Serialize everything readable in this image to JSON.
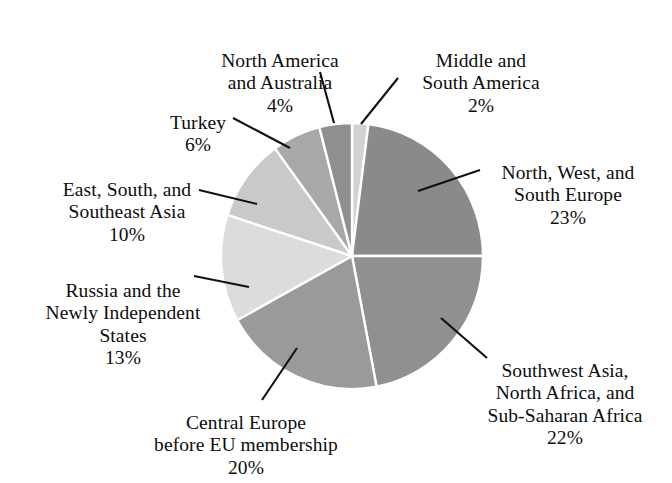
{
  "chart_data": {
    "type": "pie",
    "title": "",
    "subtitle": "",
    "xlabel": "",
    "ylabel": "",
    "legend_position": "none",
    "grid": false,
    "units": "percent",
    "start_angle_deg": 0,
    "direction": "clockwise",
    "center": {
      "x": 352,
      "y": 256
    },
    "radius": {
      "rx": 131,
      "ry": 133
    },
    "slice_gap_color": "#ffffff",
    "categories": [
      "Middle and South America",
      "North, West, and South Europe",
      "Southwest Asia, North Africa, and Sub-Saharan Africa",
      "Central Europe before EU membership",
      "Russia and the Newly Independent States",
      "East, South, and Southeast Asia",
      "Turkey",
      "North America and Australia"
    ],
    "values": [
      2,
      23,
      22,
      20,
      13,
      10,
      6,
      4
    ],
    "colors": [
      "#d2d2d2",
      "#8a8a8a",
      "#909090",
      "#9a9a9a",
      "#dcdcdc",
      "#c9c9c9",
      "#a8a8a8",
      "#8f8f8f"
    ],
    "slices": [
      {
        "id": "middle-south-america",
        "label": "Middle and\nSouth America",
        "percent_text": "2%",
        "value": 2,
        "color": "#d2d2d2",
        "start_deg": 0.0,
        "end_deg": 7.2
      },
      {
        "id": "north-west-south-europe",
        "label": "North, West, and\nSouth Europe",
        "percent_text": "23%",
        "value": 23,
        "color": "#8a8a8a",
        "start_deg": 7.2,
        "end_deg": 90.0
      },
      {
        "id": "southwest-asia-africa",
        "label": "Southwest Asia,\nNorth Africa, and\nSub-Saharan Africa",
        "percent_text": "22%",
        "value": 22,
        "color": "#909090",
        "start_deg": 90.0,
        "end_deg": 169.2
      },
      {
        "id": "central-europe",
        "label": "Central Europe\nbefore EU membership",
        "percent_text": "20%",
        "value": 20,
        "color": "#9a9a9a",
        "start_deg": 169.2,
        "end_deg": 241.2
      },
      {
        "id": "russia-nis",
        "label": "Russia and the\nNewly Independent\nStates",
        "percent_text": "13%",
        "value": 13,
        "color": "#dcdcdc",
        "start_deg": 241.2,
        "end_deg": 288.0
      },
      {
        "id": "east-south-asia",
        "label": "East, South, and\nSoutheast Asia",
        "percent_text": "10%",
        "value": 10,
        "color": "#c9c9c9",
        "start_deg": 288.0,
        "end_deg": 324.0
      },
      {
        "id": "turkey",
        "label": "Turkey",
        "percent_text": "6%",
        "value": 6,
        "color": "#a8a8a8",
        "start_deg": 324.0,
        "end_deg": 345.6
      },
      {
        "id": "north-america-australia",
        "label": "North America\nand Australia",
        "percent_text": "4%",
        "value": 4,
        "color": "#8f8f8f",
        "start_deg": 345.6,
        "end_deg": 360.0
      }
    ]
  },
  "labels": {
    "north_america_australia": {
      "text": "North America\nand Australia",
      "percent": "4%"
    },
    "middle_south_america": {
      "text": "Middle and\nSouth America",
      "percent": "2%"
    },
    "turkey": {
      "text": "Turkey",
      "percent": "6%"
    },
    "east_south_asia": {
      "text": "East, South, and\nSoutheast Asia",
      "percent": "10%"
    },
    "russia_nis": {
      "text": "Russia and the\nNewly Independent\nStates",
      "percent": "13%"
    },
    "north_west_south_europe": {
      "text": "North, West, and\nSouth Europe",
      "percent": "23%"
    },
    "southwest_asia_africa": {
      "text": "Southwest Asia,\nNorth Africa, and\nSub-Saharan Africa",
      "percent": "22%"
    },
    "central_europe": {
      "text": "Central Europe\nbefore EU membership",
      "percent": "20%"
    }
  }
}
